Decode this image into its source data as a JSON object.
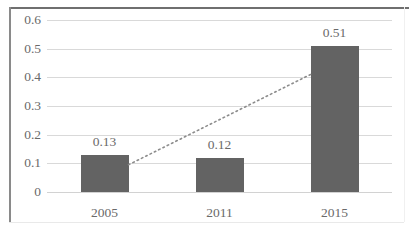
{
  "chart_data": {
    "type": "bar",
    "title": "",
    "subtitle": "",
    "xlabel": "",
    "ylabel": "",
    "categories": [
      "2005",
      "2011",
      "2015"
    ],
    "values": [
      0.13,
      0.12,
      0.51
    ],
    "data_labels": [
      "0.13",
      "0.12",
      "0.51"
    ],
    "ylim": [
      0,
      0.6
    ],
    "ytick_labels": [
      "0",
      "0.1",
      "0.2",
      "0.3",
      "0.4",
      "0.5",
      "0.6"
    ],
    "ytick_values": [
      0,
      0.1,
      0.2,
      0.3,
      0.4,
      0.5,
      0.6
    ],
    "grid": true,
    "legend": "none",
    "series": [
      {
        "name": "value",
        "type": "bar",
        "values": [
          0.13,
          0.12,
          0.51
        ],
        "color": "#636363"
      },
      {
        "name": "trendline",
        "type": "line",
        "style": "dotted",
        "color": "#8c8c8c",
        "x": [
          0.13,
          0.51
        ],
        "y": [
          0.095,
          0.41
        ]
      }
    ]
  },
  "axes": {
    "y": {
      "ticks": [
        {
          "label": "0.6",
          "value": 0.6
        },
        {
          "label": "0.5",
          "value": 0.5
        },
        {
          "label": "0.4",
          "value": 0.4
        },
        {
          "label": "0.3",
          "value": 0.3
        },
        {
          "label": "0.2",
          "value": 0.2
        },
        {
          "label": "0.1",
          "value": 0.1
        },
        {
          "label": "0",
          "value": 0
        }
      ]
    },
    "x": {
      "ticks": [
        {
          "label": "2005"
        },
        {
          "label": "2011"
        },
        {
          "label": "2015"
        }
      ]
    }
  },
  "bars": [
    {
      "category": "2005",
      "value": 0.13,
      "label": "0.13"
    },
    {
      "category": "2011",
      "value": 0.12,
      "label": "0.12"
    },
    {
      "category": "2015",
      "value": 0.51,
      "label": "0.51"
    }
  ],
  "colors": {
    "bar": "#636363",
    "gridline": "#d9d9d9",
    "text": "#6a6a6a",
    "frame": "#6f6f6f",
    "trendline": "#8c8c8c",
    "background": "#ffffff"
  }
}
